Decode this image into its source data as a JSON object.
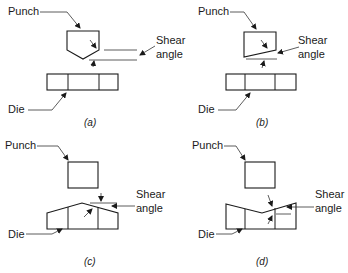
{
  "figure": {
    "panels": [
      {
        "id": "a",
        "caption": "(a)",
        "punch_label": "Punch",
        "die_label": "Die",
        "shear_label_line1": "Shear",
        "shear_label_line2": "angle",
        "description": "Punch with V-shaped (pointed) face, flat die"
      },
      {
        "id": "b",
        "caption": "(b)",
        "punch_label": "Punch",
        "die_label": "Die",
        "shear_label_line1": "Shear",
        "shear_label_line2": "angle",
        "description": "Punch with single inclined face, flat die"
      },
      {
        "id": "c",
        "caption": "(c)",
        "punch_label": "Punch",
        "die_label": "Die",
        "shear_label_line1": "Shear",
        "shear_label_line2": "angle",
        "description": "Flat punch, die with convex (peaked) shear face"
      },
      {
        "id": "d",
        "caption": "(d)",
        "punch_label": "Punch",
        "die_label": "Die",
        "shear_label_line1": "Shear",
        "shear_label_line2": "angle",
        "description": "Flat punch, die with concave (V) shear face"
      }
    ]
  }
}
